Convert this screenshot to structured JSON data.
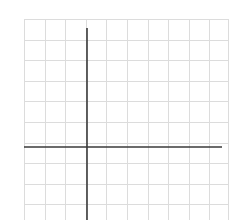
{
  "diagram": {
    "type": "coordinate-grid",
    "background": "#ffffff",
    "grid": {
      "color": "#dcdcdc",
      "left": 24,
      "top": 19,
      "right": 228,
      "bottom": 220,
      "spacing": 20.6,
      "columns": 10,
      "rows": 10
    },
    "axes": {
      "color": "#3a3a3a",
      "width": 1.6,
      "x_axis": {
        "y": 147,
        "x_start": 24,
        "x_end": 222
      },
      "y_axis": {
        "x": 87,
        "y_start": 28,
        "y_end": 220
      }
    }
  }
}
